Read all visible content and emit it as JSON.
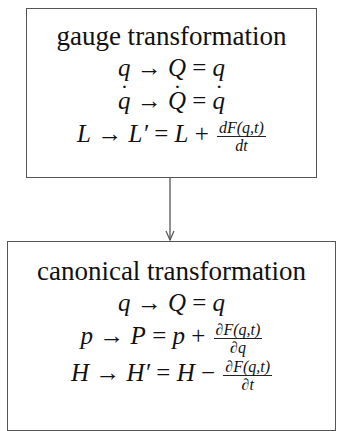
{
  "diagram": {
    "nodes": [
      {
        "id": "gauge",
        "title": "gauge transformation",
        "equations": {
          "q": {
            "lhs": "q",
            "arrow": "→",
            "mid": "Q",
            "eq": "=",
            "rhs": "q"
          },
          "qdot": {
            "lhs": "q",
            "arrow": "→",
            "mid": "Q",
            "eq": "=",
            "rhs": "q"
          },
          "L": {
            "lhs": "L",
            "arrow": "→",
            "mid": "L′",
            "eq": "=",
            "rhs": "L",
            "op": "+",
            "frac_num": "dF(q,t)",
            "frac_den": "dt"
          }
        }
      },
      {
        "id": "canonical",
        "title": "canonical transformation",
        "equations": {
          "q": {
            "lhs": "q",
            "arrow": "→",
            "mid": "Q",
            "eq": "=",
            "rhs": "q"
          },
          "p": {
            "lhs": "p",
            "arrow": "→",
            "mid": "P",
            "eq": "=",
            "rhs": "p",
            "op": "+",
            "frac_num": "∂F(q,t)",
            "frac_den": "∂q"
          },
          "H": {
            "lhs": "H",
            "arrow": "→",
            "mid": "H′",
            "eq": "=",
            "rhs": "H",
            "op": "−",
            "frac_num": "∂F(q,t)",
            "frac_den": "∂t"
          }
        }
      }
    ],
    "edges": [
      {
        "from": "gauge",
        "to": "canonical"
      }
    ],
    "colors": {
      "border": "#555555",
      "text": "#111111",
      "background": "#ffffff"
    }
  }
}
